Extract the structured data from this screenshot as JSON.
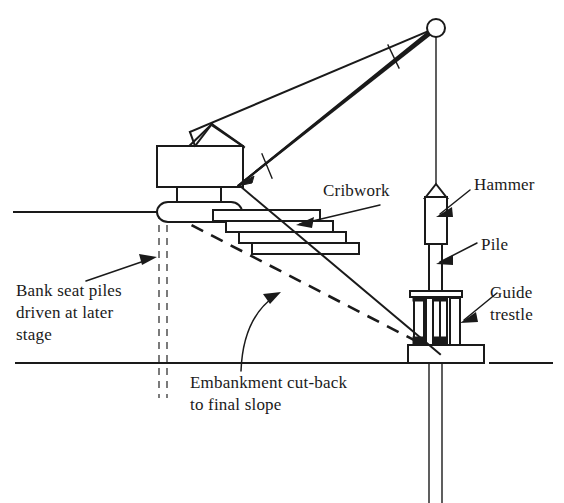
{
  "figure": {
    "line_color": "#1a1a1a",
    "background": "#ffffff"
  },
  "labels": {
    "cribwork": "Cribwork",
    "hammer": "Hammer",
    "pile": "Pile",
    "guide_trestle_line1": "Guide",
    "guide_trestle_line2": "trestle",
    "bank_seat_line1": "Bank seat piles",
    "bank_seat_line2": "driven at later",
    "bank_seat_line3": "stage",
    "embankment_line1": "Embankment cut-back",
    "embankment_line2": "to final slope"
  },
  "components": {
    "crane_house": "crane-machine-house",
    "boom": "lattice-boom",
    "pulley": "sheave-pulley",
    "hoist_rope": "hoist-rope",
    "slew_base": "slew-ring-base",
    "cribwork_bars": 4,
    "trestle_posts": 2,
    "ground_lines": 2,
    "bank_seat_pile_lines": 2
  }
}
